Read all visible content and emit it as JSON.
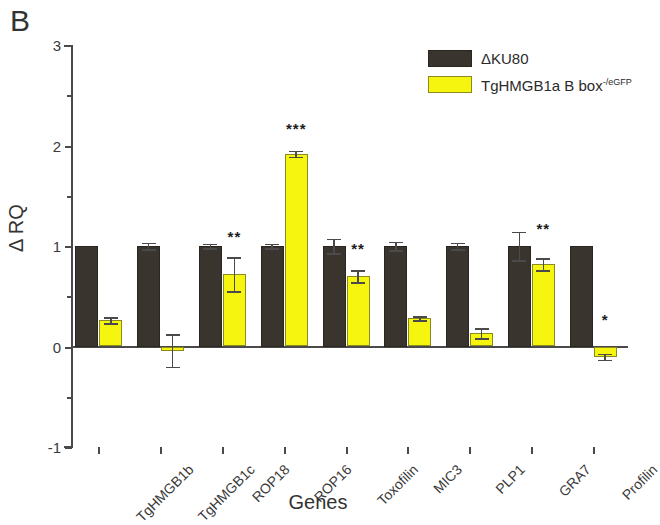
{
  "panel": {
    "label": "B"
  },
  "legend": {
    "position": "top-right",
    "entries": [
      {
        "label": "ΔKU80",
        "color": "#3a342e",
        "swatch": "dark"
      },
      {
        "label": "TgHMGB1a B box",
        "superscript": "-/eGFP",
        "color": "#f5f510",
        "swatch": "yellow"
      }
    ]
  },
  "axes": {
    "y_title": "Δ RQ",
    "x_title": "Genes",
    "y_ticks": [
      "3",
      "2",
      "1",
      "0",
      "-1"
    ],
    "y_tick_values": [
      3,
      2,
      1,
      0,
      -1
    ],
    "y_minor_values": [
      2.5,
      1.5,
      0.5,
      -0.5
    ],
    "ylim": [
      -1,
      3
    ]
  },
  "chart_data": {
    "type": "bar",
    "title": "B",
    "xlabel": "Genes",
    "ylabel": "Δ RQ",
    "ylim": [
      -1,
      3
    ],
    "grid": false,
    "legend_position": "top-right",
    "categories": [
      "TgHMGB1b",
      "TgHMGB1c",
      "ROP18",
      "ROP16",
      "Toxofilin",
      "MIC3",
      "PLP1",
      "GRA7",
      "Profilin"
    ],
    "series": [
      {
        "name": "ΔKU80",
        "color": "#3a342e",
        "values": [
          1.0,
          1.0,
          1.0,
          1.0,
          1.0,
          1.0,
          1.0,
          1.0,
          1.0
        ],
        "errors": [
          0.0,
          0.03,
          0.02,
          0.02,
          0.07,
          0.04,
          0.03,
          0.14,
          0.0
        ]
      },
      {
        "name": "TgHMGB1a B box-/eGFP",
        "color": "#f5f510",
        "values": [
          0.26,
          -0.04,
          0.72,
          1.92,
          0.7,
          0.28,
          0.13,
          0.82,
          -0.1
        ],
        "errors": [
          0.03,
          0.16,
          0.17,
          0.03,
          0.06,
          0.02,
          0.05,
          0.06,
          0.03
        ]
      }
    ],
    "significance": [
      "",
      "",
      "**",
      "***",
      "**",
      "",
      "",
      "**",
      "*"
    ],
    "significance_y": [
      null,
      null,
      1.05,
      2.12,
      0.93,
      null,
      null,
      1.13,
      0.22
    ]
  }
}
